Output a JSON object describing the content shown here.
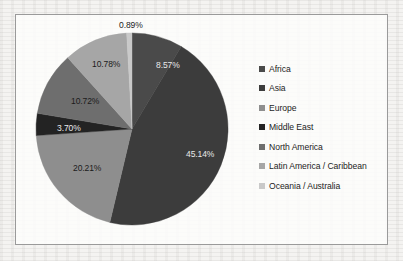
{
  "chart_data": {
    "type": "pie",
    "title": "",
    "legend_position": "right",
    "grid": false,
    "categories": [
      "Africa",
      "Asia",
      "Europe",
      "Middle East",
      "North America",
      "Latin America / Caribbean",
      "Oceania / Australia"
    ],
    "values": [
      8.57,
      45.14,
      20.21,
      3.7,
      10.72,
      10.78,
      0.89
    ],
    "value_labels": [
      "8.57%",
      "45.14%",
      "20.21%",
      "3.70%",
      "10.72%",
      "10.78%",
      "0.89%"
    ],
    "colors": [
      "#4a4a4a",
      "#3c3c3c",
      "#8e8e8e",
      "#232323",
      "#6e6e6e",
      "#a6a6a6",
      "#c9c9c9"
    ],
    "units": "percent",
    "total": 100.01
  },
  "frame": {
    "border_color": "#9a9a9a",
    "background": "#fdfdfc"
  },
  "legend": {
    "items": [
      {
        "label": "Africa",
        "color": "#4a4a4a"
      },
      {
        "label": "Asia",
        "color": "#3c3c3c"
      },
      {
        "label": "Europe",
        "color": "#8e8e8e"
      },
      {
        "label": "Middle East",
        "color": "#232323"
      },
      {
        "label": "North America",
        "color": "#6e6e6e"
      },
      {
        "label": "Latin America / Caribbean",
        "color": "#a6a6a6"
      },
      {
        "label": "Oceania / Australia",
        "color": "#c9c9c9"
      }
    ]
  },
  "labels": {
    "africa": "8.57%",
    "asia": "45.14%",
    "europe": "20.21%",
    "middle_east": "3.70%",
    "north_america": "10.72%",
    "latin_america": "10.78%",
    "oceania": "0.89%"
  }
}
